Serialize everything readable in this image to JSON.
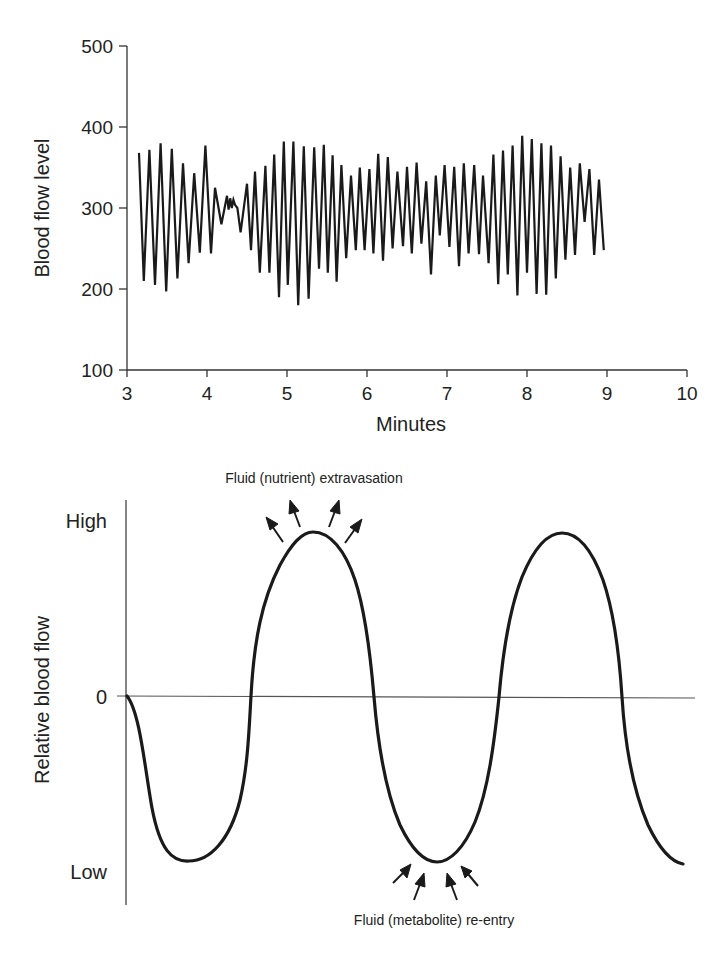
{
  "chart_data": [
    {
      "type": "line",
      "title": "",
      "xlabel": "Minutes",
      "ylabel": "Blood flow level",
      "xlim": [
        3,
        10
      ],
      "ylim": [
        100,
        500
      ],
      "x_ticks": [
        "3",
        "4",
        "5",
        "6",
        "7",
        "8",
        "9",
        "10"
      ],
      "y_ticks": [
        "100",
        "200",
        "300",
        "400",
        "500"
      ],
      "grid": false,
      "legend": null,
      "series": [
        {
          "name": "Blood flow level",
          "x": [
            3.15,
            3.21,
            3.28,
            3.35,
            3.42,
            3.49,
            3.56,
            3.63,
            3.7,
            3.77,
            3.84,
            3.91,
            3.98,
            4.05,
            4.1,
            4.18,
            4.25,
            4.27,
            4.29,
            4.31,
            4.33,
            4.35,
            4.38,
            4.42,
            4.5,
            4.55,
            4.6,
            4.66,
            4.73,
            4.78,
            4.84,
            4.9,
            4.96,
            5.01,
            5.08,
            5.14,
            5.21,
            5.27,
            5.34,
            5.4,
            5.46,
            5.51,
            5.57,
            5.62,
            5.68,
            5.74,
            5.8,
            5.86,
            5.91,
            5.97,
            6.03,
            6.08,
            6.14,
            6.2,
            6.26,
            6.32,
            6.38,
            6.45,
            6.5,
            6.56,
            6.62,
            6.68,
            6.74,
            6.8,
            6.86,
            6.91,
            6.97,
            7.03,
            7.09,
            7.15,
            7.21,
            7.27,
            7.34,
            7.4,
            7.45,
            7.52,
            7.58,
            7.64,
            7.7,
            7.76,
            7.82,
            7.88,
            7.94,
            8.0,
            8.06,
            8.12,
            8.18,
            8.24,
            8.3,
            8.36,
            8.42,
            8.48,
            8.54,
            8.6,
            8.66,
            8.72,
            8.78,
            8.84,
            8.9,
            8.96,
            9.02,
            9.08,
            9.13,
            9.19,
            9.25,
            9.31,
            9.37,
            9.43,
            9.48,
            9.54,
            9.6,
            9.66,
            9.72,
            9.78,
            9.83
          ],
          "y": [
            368,
            210,
            372,
            205,
            380,
            197,
            373,
            213,
            355,
            232,
            343,
            245,
            377,
            244,
            325,
            280,
            315,
            298,
            312,
            300,
            310,
            304,
            300,
            270,
            330,
            248,
            345,
            220,
            352,
            220,
            366,
            190,
            382,
            205,
            382,
            180,
            376,
            188,
            375,
            225,
            378,
            220,
            365,
            209,
            353,
            238,
            340,
            248,
            350,
            248,
            348,
            244,
            367,
            235,
            363,
            250,
            345,
            253,
            351,
            244,
            356,
            256,
            333,
            218,
            340,
            266,
            353,
            252,
            351,
            228,
            355,
            244,
            353,
            243,
            340,
            232,
            366,
            206,
            371,
            218,
            377,
            192,
            389,
            220,
            385,
            194,
            380,
            193,
            377,
            213,
            364,
            236,
            350,
            242,
            355,
            283,
            348,
            242,
            335,
            248
          ]
        }
      ]
    },
    {
      "type": "line",
      "title": "",
      "xlabel": "",
      "ylabel": "Relative blood flow",
      "y_ticks": [
        "High",
        "0",
        "Low"
      ],
      "grid": false,
      "legend": null,
      "annotations": [
        {
          "text": "Fluid (nutrient) extravasation",
          "position": "above first peak",
          "arrows": 4,
          "direction": "outward"
        },
        {
          "text": "Fluid (metabolite) re-entry",
          "position": "below second trough",
          "arrows": 4,
          "direction": "inward"
        }
      ],
      "series": [
        {
          "name": "Relative blood flow (schematic)",
          "x": [
            0,
            0.5,
            1.0,
            1.5,
            2.0,
            2.5,
            3.0,
            3.5,
            4.0,
            4.25
          ],
          "y": [
            0,
            -1,
            0,
            1,
            0,
            -1,
            0,
            1,
            0,
            -1
          ],
          "note": "Schematic sinusoidal oscillation starting at 0, dipping to Low, rising to High twice"
        }
      ]
    }
  ],
  "top_chart": {
    "ylabel": "Blood flow level",
    "xlabel": "Minutes",
    "y_ticks": [
      {
        "label": "500",
        "value": 500
      },
      {
        "label": "400",
        "value": 400
      },
      {
        "label": "300",
        "value": 300
      },
      {
        "label": "200",
        "value": 200
      },
      {
        "label": "100",
        "value": 100
      }
    ],
    "x_ticks": [
      {
        "label": "3",
        "value": 3
      },
      {
        "label": "4",
        "value": 4
      },
      {
        "label": "5",
        "value": 5
      },
      {
        "label": "6",
        "value": 6
      },
      {
        "label": "7",
        "value": 7
      },
      {
        "label": "8",
        "value": 8
      },
      {
        "label": "9",
        "value": 9
      },
      {
        "label": "10",
        "value": 10
      }
    ]
  },
  "bottom_chart": {
    "ylabel": "Relative blood flow",
    "y_labels": {
      "high": "High",
      "zero": "0",
      "low": "Low"
    },
    "top_annotation": "Fluid (nutrient) extravasation",
    "bottom_annotation": "Fluid (metabolite) re-entry"
  },
  "colors": {
    "ink": "#1a1a1a",
    "axis": "#333333",
    "background": "#ffffff"
  }
}
